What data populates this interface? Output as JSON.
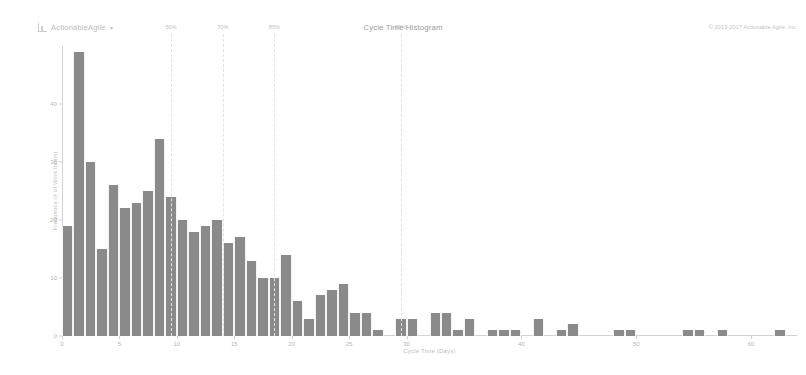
{
  "header": {
    "brand": "ActionableAgile",
    "brand_caret": "▾",
    "title": "Cycle Time Histogram",
    "copyright": "© 2013-2017 Actionable Agile, Inc"
  },
  "colors": {
    "bar": "#8a8a8a",
    "axis": "#d2d2d2",
    "percentile_line": "#e2e2e2",
    "text": "#b5b5b5",
    "background": "#ffffff"
  },
  "chart_data": {
    "type": "bar",
    "title": "Cycle Time Histogram",
    "xlabel": "Cycle Time (Days)",
    "ylabel": "Frequency (# of Work Items)",
    "xlim": [
      0,
      64
    ],
    "ylim": [
      0,
      50
    ],
    "xticks": [
      0,
      5,
      10,
      15,
      20,
      25,
      30,
      40,
      50,
      60
    ],
    "yticks": [
      0,
      10,
      20,
      30,
      40
    ],
    "grid": false,
    "legend": false,
    "bin_width": 1,
    "categories": [
      1,
      2,
      3,
      4,
      5,
      6,
      7,
      8,
      9,
      10,
      11,
      12,
      13,
      14,
      15,
      16,
      17,
      18,
      19,
      20,
      21,
      22,
      23,
      24,
      25,
      26,
      27,
      28,
      29,
      30,
      31,
      32,
      33,
      34,
      35,
      36,
      37,
      38,
      39,
      40,
      41,
      42,
      43,
      44,
      45,
      46,
      47,
      48,
      49,
      50,
      51,
      52,
      53,
      54,
      55,
      56,
      57,
      58,
      59,
      60,
      61,
      62,
      63
    ],
    "values": [
      19,
      49,
      30,
      15,
      26,
      22,
      23,
      25,
      34,
      24,
      20,
      18,
      19,
      20,
      16,
      17,
      13,
      10,
      10,
      14,
      6,
      3,
      7,
      8,
      9,
      4,
      4,
      1,
      0,
      3,
      3,
      0,
      4,
      4,
      1,
      3,
      0,
      1,
      1,
      1,
      0,
      3,
      0,
      1,
      2,
      0,
      0,
      0,
      1,
      1,
      0,
      0,
      0,
      0,
      1,
      1,
      0,
      1,
      0,
      0,
      0,
      0,
      1
    ],
    "percentiles": [
      {
        "label": "50%",
        "x": 9.5
      },
      {
        "label": "70%",
        "x": 14.0
      },
      {
        "label": "85%",
        "x": 18.5
      },
      {
        "label": "95%",
        "x": 29.5
      }
    ]
  }
}
